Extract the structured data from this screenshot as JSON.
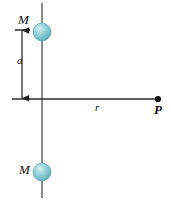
{
  "figure": {
    "background_color": "#ffffff",
    "width": 171,
    "height": 204,
    "line_color": "#4d4d4d",
    "axis_color": "#333333",
    "label_color": "#111111",
    "sphere": {
      "fill_color": "#7fc5ce",
      "highlight_color": "#c7e6ea",
      "edge_color": "#4f9aa4",
      "radius": 9
    },
    "labels": {
      "mass_top": "M",
      "mass_bottom": "M",
      "separation": "a",
      "distance": "r",
      "point": "P"
    },
    "geometry": {
      "vertical_axis_x": 42,
      "vertical_axis_top_y": 3,
      "vertical_axis_bottom_y": 198,
      "horizontal_axis_y": 99,
      "horizontal_axis_left_x": 12,
      "horizontal_axis_right_x": 159,
      "mass_top_center": [
        42,
        32
      ],
      "mass_bottom_center": [
        42,
        172
      ],
      "dimension_arrow_x": 22,
      "dimension_arrow_top_y": 30,
      "dimension_arrow_bottom_y": 98,
      "point_p": [
        158,
        99
      ]
    }
  }
}
